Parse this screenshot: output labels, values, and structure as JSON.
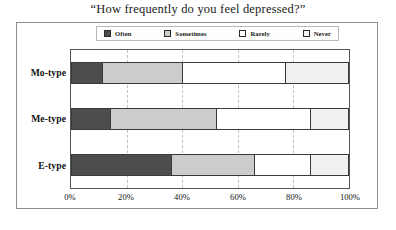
{
  "chart_data": {
    "type": "bar",
    "orientation": "horizontal",
    "stacked": true,
    "normalized_percent": true,
    "title": "“How frequently do you feel depressed?”",
    "xlabel": "",
    "ylabel": "",
    "xlim": [
      0,
      100
    ],
    "xticks": [
      "0%",
      "20%",
      "40%",
      "60%",
      "80%",
      "100%"
    ],
    "xtick_values": [
      0,
      20,
      40,
      60,
      80,
      100
    ],
    "grid": true,
    "grid_axis": "x",
    "legend_position": "top-center",
    "categories": [
      "Mo-type",
      "Me-type",
      "E-type"
    ],
    "series": [
      {
        "name": "Often",
        "color": "#4d4d4d",
        "values": [
          11,
          14,
          36
        ]
      },
      {
        "name": "Sometimes",
        "color": "#cccccc",
        "values": [
          29,
          38,
          30
        ]
      },
      {
        "name": "Rarely",
        "color": "#ffffff",
        "values": [
          37,
          34,
          20
        ]
      },
      {
        "name": "Never",
        "color": "#f0f0f0",
        "values": [
          23,
          14,
          14
        ]
      }
    ],
    "stack_boundaries_percent": {
      "Mo-type": [
        0,
        11,
        40,
        77,
        100
      ],
      "Me-type": [
        0,
        14,
        52,
        86,
        100
      ],
      "E-type": [
        0,
        36,
        66,
        86,
        100
      ]
    }
  },
  "legend": {
    "items": [
      {
        "label": "Often",
        "swatch": "legend-swatch-often",
        "color": "#4d4d4d"
      },
      {
        "label": "Sometimes",
        "swatch": "legend-swatch-sometimes",
        "color": "#cccccc"
      },
      {
        "label": "Rarely",
        "swatch": "legend-swatch-rarely",
        "color": "#ffffff"
      },
      {
        "label": "Never",
        "swatch": "legend-swatch-never",
        "color": "#f5f5f5"
      }
    ]
  },
  "colors": {
    "often": "#4d4d4d",
    "sometimes": "#cccccc",
    "rarely": "#ffffff",
    "never": "#f0f0f0",
    "segment_border": "#3a3a3a",
    "frame_border": "#8f8f8f",
    "gridline": "#c2c2c2",
    "text": "#111111",
    "background": "#ffffff"
  }
}
